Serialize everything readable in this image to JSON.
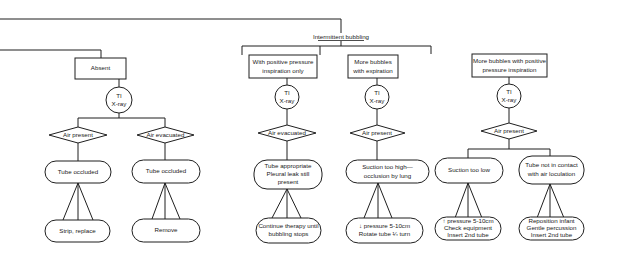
{
  "diagram": {
    "colors": {
      "stroke": "#1f1f1f",
      "text": "#1a1a1a",
      "background": "#ffffff"
    },
    "branch_label": "Intermittent bubbling",
    "absent": {
      "condition": "Absent",
      "check": [
        "TI",
        "X-ray"
      ],
      "left": {
        "finding": "Air present",
        "cause": [
          "Tube occluded"
        ],
        "action": [
          "Strip, replace"
        ]
      },
      "right": {
        "finding": "Air evacuated",
        "cause": [
          "Tube occluded"
        ],
        "action": [
          "Remove"
        ]
      }
    },
    "intermittent": [
      {
        "condition": [
          "With positive pressure",
          "inspiration only"
        ],
        "check": [
          "TI",
          "X-ray"
        ],
        "finding": "Air evacuated",
        "cause": [
          "Tube appropriate",
          "Pleural leak still",
          "present"
        ],
        "action": [
          "Continue therapy until",
          "bubbling stops"
        ]
      },
      {
        "condition": [
          "More bubbles",
          "with expiration"
        ],
        "check": [
          "TI",
          "X-ray"
        ],
        "finding": "Air present",
        "cause": [
          "Suction too high—",
          "occlusion by lung"
        ],
        "action": [
          "↓ pressure 5-10cm",
          "Rotate tube ¼ turn"
        ]
      },
      {
        "condition": [
          "More bubbles with positive",
          "pressure inspiration"
        ],
        "check": [
          "TI",
          "X-ray"
        ],
        "finding": "Air present",
        "left": {
          "cause": [
            "Suction too low"
          ],
          "action": [
            "↑ pressure 5-10cm",
            "Check equipment",
            "Insert 2nd tube"
          ]
        },
        "right": {
          "cause": [
            "Tube not in contact",
            "with air  loculation"
          ],
          "action": [
            "Reposition infant",
            "Gentle percussion",
            "Insert 2nd tube"
          ]
        }
      }
    ]
  }
}
